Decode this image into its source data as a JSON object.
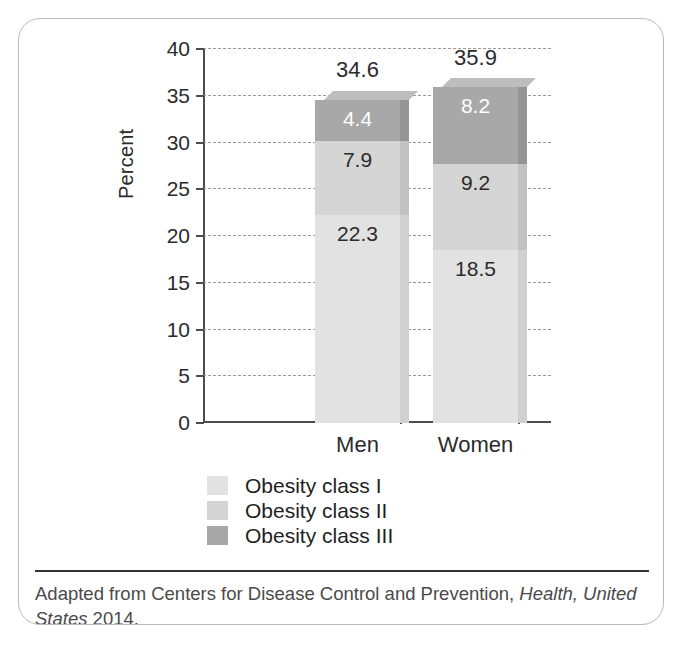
{
  "chart_data": {
    "type": "bar",
    "subtype": "stacked-bar-3d",
    "title": "",
    "xlabel": "",
    "ylabel": "Percent",
    "ylim": [
      0,
      40
    ],
    "ytick_step": 5,
    "yticks": [
      "40",
      "35",
      "30",
      "25",
      "20",
      "15",
      "10",
      "5",
      "0"
    ],
    "categories": [
      "Men",
      "Women"
    ],
    "grid": true,
    "grid_style": "dashed-horizontal",
    "legend_position": "bottom-center",
    "series": [
      {
        "name": "Obesity class I",
        "color": "#e2e2e2",
        "top_color": "#eeeeee",
        "side_color": "#d0d0d0",
        "label_color": "#2b2b2b",
        "values": [
          22.3,
          18.5
        ],
        "value_labels": [
          "22.3",
          "18.5"
        ]
      },
      {
        "name": "Obesity class II",
        "color": "#d5d5d5",
        "top_color": "#e3e3e3",
        "side_color": "#c2c2c2",
        "label_color": "#2b2b2b",
        "values": [
          7.9,
          9.2
        ],
        "value_labels": [
          "7.9",
          "9.2"
        ]
      },
      {
        "name": "Obesity class III",
        "color": "#a8a8a8",
        "top_color": "#bdbdbd",
        "side_color": "#949494",
        "label_color": "#ffffff",
        "values": [
          4.4,
          8.2
        ],
        "value_labels": [
          "4.4",
          "8.2"
        ]
      }
    ],
    "totals": [
      34.6,
      35.9
    ],
    "total_labels": [
      "34.6",
      "35.9"
    ]
  },
  "axis": {
    "y_title": "Percent",
    "ticks": [
      {
        "label": "40",
        "value": 40
      },
      {
        "label": "35",
        "value": 35
      },
      {
        "label": "30",
        "value": 30
      },
      {
        "label": "25",
        "value": 25
      },
      {
        "label": "20",
        "value": 20
      },
      {
        "label": "15",
        "value": 15
      },
      {
        "label": "10",
        "value": 10
      },
      {
        "label": "5",
        "value": 5
      },
      {
        "label": "0",
        "value": 0
      }
    ]
  },
  "categories": [
    {
      "label": "Men"
    },
    {
      "label": "Women"
    }
  ],
  "legend": {
    "items": [
      {
        "label": "Obesity class I",
        "color": "#e2e2e2"
      },
      {
        "label": "Obesity class II",
        "color": "#d5d5d5"
      },
      {
        "label": "Obesity class III",
        "color": "#a8a8a8"
      }
    ]
  },
  "footnote": {
    "prefix": "Adapted from Centers for Disease Control and Prevention, ",
    "italic": "Health, United States",
    "suffix": " 2014."
  },
  "colors": {
    "axis": "#4d4d4d",
    "grid": "#9a9a9a",
    "text": "#2b2b2b",
    "card_border": "#b9b9b9",
    "footnote_rule": "#333333",
    "footnote_text": "#4a4a4a"
  }
}
